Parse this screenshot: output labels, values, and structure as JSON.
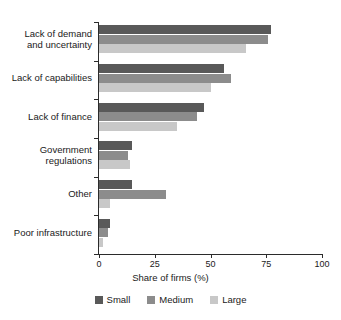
{
  "chart_data": {
    "type": "bar",
    "orientation": "horizontal",
    "title": "",
    "xlabel": "Share of firms (%)",
    "ylabel": "",
    "xlim": [
      0,
      100
    ],
    "xticks": [
      0,
      25,
      50,
      75,
      100
    ],
    "xtick_labels": [
      "0",
      "25",
      "50",
      "75",
      "100"
    ],
    "grid": false,
    "legend_position": "bottom",
    "categories": [
      "Lack of demand\nand uncertainty",
      "Lack of capabilities",
      "Lack of finance",
      "Government\nregulations",
      "Other",
      "Poor infrastructure"
    ],
    "series": [
      {
        "name": "Small",
        "color": "#595959",
        "values": [
          77,
          56,
          47,
          15,
          15,
          5
        ]
      },
      {
        "name": "Medium",
        "color": "#8c8c8c",
        "values": [
          76,
          59,
          44,
          13,
          30,
          4
        ]
      },
      {
        "name": "Large",
        "color": "#c8c8c8",
        "values": [
          66,
          50,
          35,
          14,
          5,
          2
        ]
      }
    ]
  },
  "legend": {
    "items": [
      {
        "label": "Small",
        "color": "#595959"
      },
      {
        "label": "Medium",
        "color": "#8c8c8c"
      },
      {
        "label": "Large",
        "color": "#c8c8c8"
      }
    ]
  },
  "axis": {
    "x_title": "Share of firms (%)"
  }
}
